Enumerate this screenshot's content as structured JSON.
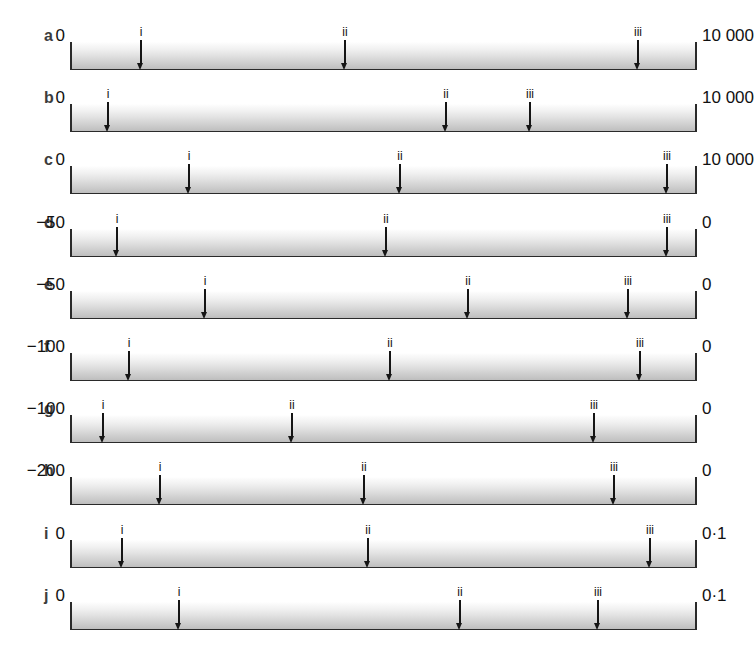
{
  "figure": {
    "bar_start_px": 70,
    "bar_end_px": 697,
    "arrow_glyph": "down-arrow",
    "rows": [
      {
        "letter": "a",
        "left_label": "0",
        "right_label": "10 000",
        "markers": [
          {
            "label": "i",
            "x": 141
          },
          {
            "label": "ii",
            "x": 345
          },
          {
            "label": "iii",
            "x": 638
          }
        ]
      },
      {
        "letter": "b",
        "left_label": "0",
        "right_label": "10 000",
        "markers": [
          {
            "label": "i",
            "x": 108
          },
          {
            "label": "ii",
            "x": 446
          },
          {
            "label": "iii",
            "x": 530
          }
        ]
      },
      {
        "letter": "c",
        "left_label": "0",
        "right_label": "10 000",
        "markers": [
          {
            "label": "i",
            "x": 189
          },
          {
            "label": "ii",
            "x": 400
          },
          {
            "label": "iii",
            "x": 667
          }
        ]
      },
      {
        "letter": "d",
        "left_label": "−50",
        "right_label": "0",
        "markers": [
          {
            "label": "i",
            "x": 117
          },
          {
            "label": "ii",
            "x": 386
          },
          {
            "label": "iii",
            "x": 667
          }
        ]
      },
      {
        "letter": "e",
        "left_label": "−50",
        "right_label": "0",
        "markers": [
          {
            "label": "i",
            "x": 205
          },
          {
            "label": "ii",
            "x": 468
          },
          {
            "label": "iii",
            "x": 628
          }
        ]
      },
      {
        "letter": "f",
        "left_label": "−100",
        "right_label": "0",
        "markers": [
          {
            "label": "i",
            "x": 129
          },
          {
            "label": "ii",
            "x": 390
          },
          {
            "label": "iii",
            "x": 640
          }
        ]
      },
      {
        "letter": "g",
        "left_label": "−100",
        "right_label": "0",
        "markers": [
          {
            "label": "i",
            "x": 103
          },
          {
            "label": "ii",
            "x": 292
          },
          {
            "label": "iii",
            "x": 594
          }
        ]
      },
      {
        "letter": "h",
        "left_label": "−200",
        "right_label": "0",
        "markers": [
          {
            "label": "i",
            "x": 160
          },
          {
            "label": "ii",
            "x": 364
          },
          {
            "label": "iii",
            "x": 614
          }
        ]
      },
      {
        "letter": "i",
        "left_label": "0",
        "right_label": "0·1",
        "markers": [
          {
            "label": "i",
            "x": 122
          },
          {
            "label": "ii",
            "x": 368
          },
          {
            "label": "iii",
            "x": 650
          }
        ]
      },
      {
        "letter": "j",
        "left_label": "0",
        "right_label": "0·1",
        "markers": [
          {
            "label": "i",
            "x": 179
          },
          {
            "label": "ii",
            "x": 460
          },
          {
            "label": "iii",
            "x": 598
          }
        ]
      }
    ]
  }
}
